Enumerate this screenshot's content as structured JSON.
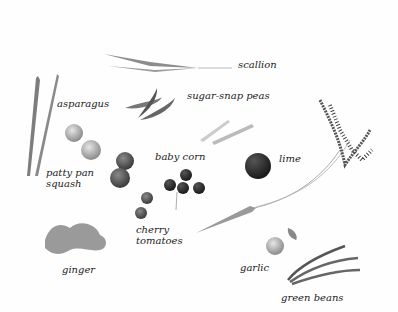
{
  "illustration": {
    "labels": {
      "scallion": "scallion",
      "asparagus": "asparagus",
      "sugar_snap_peas": "sugar-snap peas",
      "baby_corn": "baby corn",
      "lime": "lime",
      "patty_pan_squash_1": "patty pan",
      "patty_pan_squash_2": "squash",
      "cherry_tomatoes_1": "cherry",
      "cherry_tomatoes_2": "tomatoes",
      "ginger": "ginger",
      "garlic": "garlic",
      "green_beans": "green beans"
    }
  }
}
